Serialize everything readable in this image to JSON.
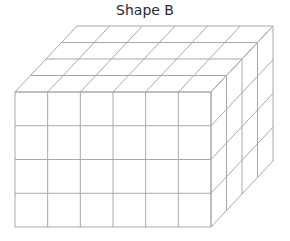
{
  "title": "Shape B",
  "shape": {
    "type": "rectangular-prism-of-unit-cubes",
    "cubes_wide": 6,
    "cubes_tall": 4,
    "cubes_deep": 4,
    "front_face": {
      "x": 15,
      "y": 92,
      "width": 196,
      "height": 135
    },
    "depth_offset": {
      "dx": 62,
      "dy": -66
    },
    "line_color": "#a8a8a8"
  }
}
